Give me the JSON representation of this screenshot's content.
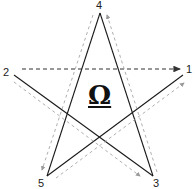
{
  "diagram": {
    "type": "pentagram",
    "center_symbol": "Ω",
    "points": [
      {
        "label": "1",
        "x": 183,
        "y": 74
      },
      {
        "label": "2",
        "x": 14,
        "y": 74
      },
      {
        "label": "3",
        "x": 153,
        "y": 176
      },
      {
        "label": "4",
        "x": 100,
        "y": 13
      },
      {
        "label": "5",
        "x": 47,
        "y": 176
      }
    ],
    "stroke_order": [
      "1",
      "2",
      "3",
      "4",
      "5",
      "1"
    ],
    "colors": {
      "solid_line": "#1a1a1a",
      "dashed_arrow": "#9a9a9a",
      "top_dashed_arrow": "#333333"
    }
  }
}
